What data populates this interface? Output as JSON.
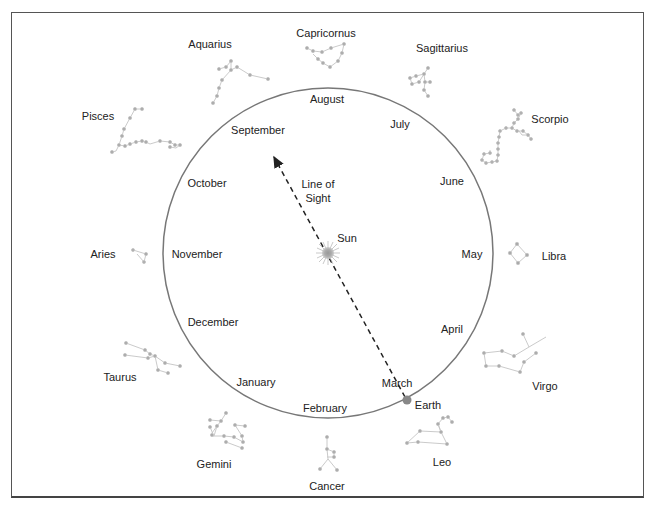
{
  "diagram": {
    "orbit": {
      "cx": 328,
      "cy": 253,
      "r": 165,
      "color": "#777777"
    },
    "sun": {
      "label": "Sun",
      "x": 328,
      "y": 253
    },
    "earth": {
      "label": "Earth",
      "x": 407,
      "y": 400
    },
    "line_of_sight": {
      "label_line1": "Line of",
      "label_line2": "Sight"
    },
    "months": [
      {
        "name": "August",
        "x": 327,
        "y": 99
      },
      {
        "name": "July",
        "x": 400,
        "y": 124
      },
      {
        "name": "June",
        "x": 452,
        "y": 181
      },
      {
        "name": "May",
        "x": 472,
        "y": 254
      },
      {
        "name": "April",
        "x": 452,
        "y": 329
      },
      {
        "name": "March",
        "x": 397,
        "y": 383
      },
      {
        "name": "February",
        "x": 325,
        "y": 408
      },
      {
        "name": "January",
        "x": 256,
        "y": 382
      },
      {
        "name": "December",
        "x": 213,
        "y": 322
      },
      {
        "name": "November",
        "x": 197,
        "y": 254
      },
      {
        "name": "October",
        "x": 207,
        "y": 183
      },
      {
        "name": "September",
        "x": 258,
        "y": 130
      }
    ],
    "constellations": [
      {
        "name": "Capricornus",
        "x": 326,
        "y": 33
      },
      {
        "name": "Sagittarius",
        "x": 442,
        "y": 48
      },
      {
        "name": "Scorpio",
        "x": 550,
        "y": 119
      },
      {
        "name": "Libra",
        "x": 554,
        "y": 256
      },
      {
        "name": "Virgo",
        "x": 545,
        "y": 386
      },
      {
        "name": "Leo",
        "x": 442,
        "y": 462
      },
      {
        "name": "Cancer",
        "x": 327,
        "y": 486
      },
      {
        "name": "Gemini",
        "x": 214,
        "y": 464
      },
      {
        "name": "Taurus",
        "x": 120,
        "y": 377
      },
      {
        "name": "Aries",
        "x": 103,
        "y": 254
      },
      {
        "name": "Pisces",
        "x": 98,
        "y": 116
      },
      {
        "name": "Aquarius",
        "x": 210,
        "y": 44
      }
    ],
    "colors": {
      "star": "#aaaaaa",
      "star_line": "#c4c4c4",
      "text": "#222222",
      "arrow": "#222222"
    }
  }
}
